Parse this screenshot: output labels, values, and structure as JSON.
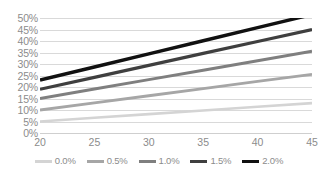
{
  "chart_data": {
    "type": "line",
    "title": "",
    "xlabel": "",
    "ylabel": "",
    "x": [
      20,
      25,
      30,
      35,
      40,
      45
    ],
    "xlim": [
      20,
      45
    ],
    "ylim": [
      0,
      0.5
    ],
    "grid": true,
    "legend_position": "bottom",
    "ytick_labels": [
      "50%",
      "45%",
      "40%",
      "35%",
      "30%",
      "25%",
      "20%",
      "15%",
      "10%",
      "5%",
      "0%"
    ],
    "ytick_values": [
      0.5,
      0.45,
      0.4,
      0.35,
      0.3,
      0.25,
      0.2,
      0.15,
      0.1,
      0.05,
      0.0
    ],
    "xtick_labels": [
      "20",
      "25",
      "30",
      "35",
      "40",
      "45"
    ],
    "series": [
      {
        "name": "0.0%",
        "color": "#d4d4d4",
        "width": 2.6,
        "values": [
          0.05,
          0.066,
          0.082,
          0.098,
          0.114,
          0.13
        ]
      },
      {
        "name": "0.5%",
        "color": "#a6a6a6",
        "width": 2.8,
        "values": [
          0.1,
          0.131,
          0.162,
          0.193,
          0.224,
          0.255
        ]
      },
      {
        "name": "1.0%",
        "color": "#7f7f7f",
        "width": 3.0,
        "values": [
          0.15,
          0.191,
          0.232,
          0.273,
          0.314,
          0.355
        ]
      },
      {
        "name": "1.5%",
        "color": "#3f3f3f",
        "width": 3.2,
        "values": [
          0.19,
          0.242,
          0.294,
          0.346,
          0.398,
          0.45
        ]
      },
      {
        "name": "2.0%",
        "color": "#111111",
        "width": 3.4,
        "values": [
          0.23,
          0.287,
          0.344,
          0.401,
          0.458,
          0.515
        ]
      }
    ]
  },
  "legend": {
    "items": [
      {
        "label": "0.0%"
      },
      {
        "label": "0.5%"
      },
      {
        "label": "1.0%"
      },
      {
        "label": "1.5%"
      },
      {
        "label": "2.0%"
      }
    ]
  },
  "colors": {
    "gridline": "#d9d9d9",
    "axis": "#cfcfcf",
    "tick_text": "#8c8c8c",
    "background": "#ffffff"
  }
}
